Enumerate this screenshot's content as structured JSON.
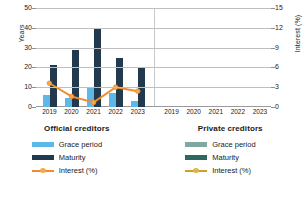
{
  "chart_data": {
    "type": "bar",
    "title": "",
    "categories": [
      "2019",
      "2020",
      "2021",
      "2022",
      "2023"
    ],
    "panels": [
      {
        "name": "Official creditors",
        "series": [
          {
            "name": "Grace period",
            "type": "bar",
            "axis": "left",
            "color": "#5BB8E8",
            "values": [
              6,
              4.5,
              10,
              7,
              3
            ]
          },
          {
            "name": "Maturity",
            "type": "bar",
            "axis": "left",
            "color": "#23394D",
            "values": [
              21,
              29,
              40,
              25,
              20
            ]
          },
          {
            "name": "Interest (%)",
            "type": "line",
            "axis": "right",
            "color": "#F08B2E",
            "values": [
              3.6,
              1.6,
              0.7,
              3.0,
              2.4
            ]
          }
        ]
      },
      {
        "name": "Private creditors",
        "series": [
          {
            "name": "Grace period",
            "type": "bar",
            "axis": "left",
            "color": "#7FA8A0",
            "values": [
              null,
              null,
              null,
              null,
              null
            ]
          },
          {
            "name": "Maturity",
            "type": "bar",
            "axis": "left",
            "color": "#2E6660",
            "values": [
              null,
              null,
              null,
              null,
              null
            ]
          },
          {
            "name": "Interest (%)",
            "type": "line",
            "axis": "right",
            "color": "#C9A227",
            "values": [
              null,
              null,
              null,
              null,
              null
            ]
          }
        ]
      }
    ],
    "left_axis": {
      "label": "Years",
      "ticks": [
        "0",
        "10",
        "20",
        "30",
        "40",
        "50"
      ],
      "min": 0,
      "max": 50
    },
    "right_axis": {
      "label": "Interest (%)",
      "ticks": [
        "0",
        "3",
        "6",
        "9",
        "12",
        "15"
      ],
      "min": 0,
      "max": 15
    },
    "xlabel": "",
    "grid": true,
    "legend_position": "bottom"
  },
  "axes": {
    "left_title": "Years",
    "right_title": "Interest (%)",
    "left_ticks": [
      "50",
      "40",
      "30",
      "20",
      "10",
      "0"
    ],
    "right_ticks": [
      "15",
      "12",
      "9",
      "6",
      "3",
      "0"
    ],
    "x_ticks_left": [
      "2019",
      "2020",
      "2021",
      "2022",
      "2023"
    ],
    "x_ticks_right": [
      "2019",
      "2020",
      "2021",
      "2022",
      "2023"
    ]
  },
  "legend": {
    "official": {
      "title": "Official creditors",
      "grace": "Grace period",
      "maturity": "Maturity",
      "interest": "Interest (%)"
    },
    "private": {
      "title": "Private creditors",
      "grace": "Grace period",
      "maturity": "Maturity",
      "interest": "Interest (%)"
    }
  },
  "colors": {
    "grace_official": "#5BB8E8",
    "maturity_official": "#23394D",
    "interest_official": "#F08B2E",
    "grace_private": "#7FA8A0",
    "maturity_private": "#2E6660",
    "interest_private": "#C9A227"
  }
}
